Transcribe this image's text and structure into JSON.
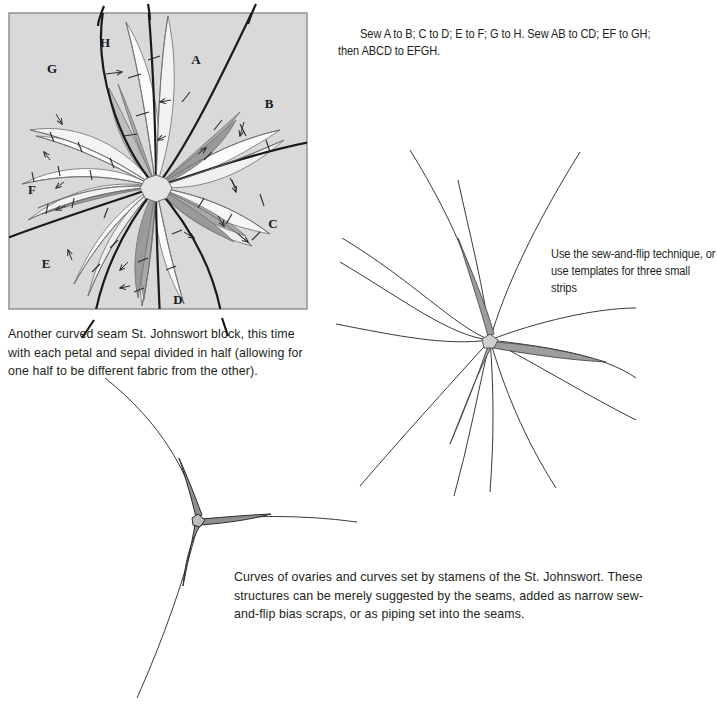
{
  "document": {
    "title": "Curved seam St. Johnswort quilt block construction diagrams"
  },
  "colors": {
    "block_background": "#d9d9d9",
    "block_border": "#8c8c8c",
    "petal_light": "#fbfbfb",
    "petal_mid": "#e9e9e9",
    "petal_dark": "#a8a8a8",
    "petal_darker": "#9a9a9a",
    "seam_heavy": "#1a1a1a",
    "seam_light": "#6e6e6e",
    "line_thin": "#3a3a3a",
    "strip_fill": "#8f8f8f",
    "text": "#231f20"
  },
  "instruction_caption": {
    "line1": "Sew A to B; C to D; E to F; G to H. Sew AB to CD; EF to GH;",
    "line2": "then ABCD to EFGH."
  },
  "block_figure": {
    "labels": [
      "A",
      "B",
      "C",
      "D",
      "E",
      "F",
      "G",
      "H"
    ],
    "label_positions": [
      {
        "text": "A",
        "x": 188,
        "y": 52
      },
      {
        "text": "B",
        "x": 261,
        "y": 96
      },
      {
        "text": "C",
        "x": 265,
        "y": 216
      },
      {
        "text": "D",
        "x": 170,
        "y": 292
      },
      {
        "text": "E",
        "x": 38,
        "y": 256
      },
      {
        "text": "F",
        "x": 24,
        "y": 182
      },
      {
        "text": "G",
        "x": 44,
        "y": 61
      },
      {
        "text": "H",
        "x": 97,
        "y": 35
      }
    ]
  },
  "block_caption": {
    "text": "Another curved seam St. Johnswort block, this time with each petal and sepal divided in half (allowing for one half to be different fabric from the other)."
  },
  "strips_caption": {
    "line1": "Use the sew-and-flip technique, or",
    "line2": "use templates for three small strips"
  },
  "ovary_caption": {
    "text": "Curves of ovaries and curves set by stamens of the St. Johnswort. These structures can be merely suggested by the seams, added as narrow sew-and-flip bias scraps, or as piping set into the seams."
  },
  "stamens_figure": {
    "description": "Radiating curved stamen seam lines with three shaded narrow strips at the center",
    "ray_count": 11,
    "strip_count": 3
  },
  "ovary_figure": {
    "description": "Three curves meeting at a Y junction with three short thick bias strips",
    "curve_count": 3,
    "strip_count": 3
  }
}
